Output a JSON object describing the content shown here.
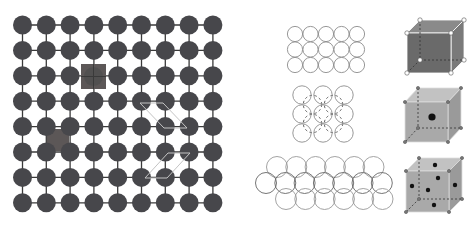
{
  "colors": {
    "background": "#ffffff",
    "atom": "#47474b",
    "bond": "#3a3a3a",
    "defect": "#5c5757",
    "dislocation_line": "#c4c4c4",
    "outline_circle": "#8c8c8c",
    "cube1_front": "#6a6a6a",
    "cube1_top": "#8a8a8a",
    "cube1_side": "#7a7a7a",
    "cube2_front": "#a9a9a9",
    "cube2_top": "#c2c2c2",
    "cube2_side": "#9a9a9a",
    "cube_edge": "#ffffff",
    "hidden_edge": "#333333",
    "atom_dot": "#111111"
  },
  "lattice": {
    "columns": 9,
    "rows": 8,
    "origin": [
      22.5,
      25
    ],
    "spacing": [
      23.8,
      25.4
    ],
    "atom_radius": 9.5,
    "vacancy_defect": {
      "label": "substitutional-defect",
      "x": 81,
      "y": 64,
      "size": 25
    },
    "interstitial_defect": {
      "label": "interstitial-cluster",
      "cx": 58,
      "cy": 140,
      "size": 22
    },
    "dislocation_paths": [
      "M140,103 L163,103 L187,128 L164,128 Z",
      "M145,178 L168,153 L190,153 L167,178 Z"
    ]
  },
  "packing_diagrams": {
    "simple_square": {
      "cols": 5,
      "rows": 3,
      "origin": [
        295,
        34
      ],
      "spacing": 15.5,
      "radius": 7.6
    },
    "bcc_layer": {
      "cols": 3,
      "rows": 3,
      "origin": [
        302,
        95
      ],
      "spacing": [
        21,
        19
      ],
      "radius": 9.2
    },
    "close_packed": {
      "radius": 10.5,
      "rows": [
        {
          "y": 167,
          "x_start": 277,
          "count": 6,
          "step": 19.3
        },
        {
          "y": 183,
          "x_start": 266,
          "count": 7,
          "step": 19.3
        },
        {
          "y": 199,
          "x_start": 286,
          "count": 6,
          "step": 19.3
        }
      ]
    }
  },
  "unit_cells": [
    {
      "name": "simple-cubic",
      "front": [
        407,
        33,
        44,
        40
      ],
      "depth": [
        13,
        -13
      ],
      "style": "dark",
      "atoms": []
    },
    {
      "name": "body-centered-cubic",
      "front": [
        405,
        102,
        43,
        40
      ],
      "depth": [
        13,
        -14
      ],
      "style": "light",
      "atoms": [
        [
          432,
          117
        ]
      ]
    },
    {
      "name": "face-centered-cubic",
      "front": [
        406,
        171,
        43,
        41
      ],
      "depth": [
        13,
        -13
      ],
      "style": "light",
      "atoms": [
        [
          435,
          165
        ],
        [
          438,
          178
        ],
        [
          412,
          186
        ],
        [
          428,
          190
        ],
        [
          455,
          185
        ],
        [
          434,
          205
        ]
      ]
    }
  ]
}
